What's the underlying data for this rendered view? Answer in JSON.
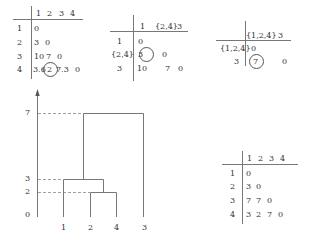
{
  "matrix_step1": {
    "col_headers": [
      "1",
      "2",
      "3",
      "4"
    ],
    "row_headers": [
      "1",
      "2",
      "3",
      "4"
    ],
    "rows": [
      [
        "0"
      ],
      [
        "3",
        "0"
      ],
      [
        "10",
        "7",
        "0"
      ],
      [
        "3.6",
        "2",
        "7.3",
        "0"
      ]
    ],
    "circled": "2"
  },
  "matrix_step2": {
    "col_headers": [
      "1",
      "{2,4}",
      "3"
    ],
    "row_headers": [
      "1",
      "{2,4}",
      "3"
    ],
    "rows": [
      [
        "0"
      ],
      [
        "3",
        "0"
      ],
      [
        "10",
        "7",
        "0"
      ]
    ],
    "circled": "3"
  },
  "matrix_step3": {
    "col_headers": [
      "{1,2,4}",
      "3"
    ],
    "row_headers": [
      "{1,2,4}",
      "3"
    ],
    "rows": [
      [
        "0"
      ],
      [
        "7",
        "0"
      ]
    ],
    "circled": "7"
  },
  "dendrogram": {
    "y_ticks": [
      "7",
      "3",
      "2",
      "0"
    ],
    "leaf_labels": [
      "1",
      "2",
      "4",
      "3"
    ],
    "merges": [
      {
        "clusters": [
          "2",
          "4"
        ],
        "height": 2
      },
      {
        "clusters": [
          "1",
          "{2,4}"
        ],
        "height": 3
      },
      {
        "clusters": [
          "{1,2,4}",
          "3"
        ],
        "height": 7
      }
    ]
  },
  "matrix_cophenetic": {
    "col_headers": [
      "1",
      "2",
      "3",
      "4"
    ],
    "row_headers": [
      "1",
      "2",
      "3",
      "4"
    ],
    "rows": [
      [
        "0"
      ],
      [
        "3",
        "0"
      ],
      [
        "7",
        "7",
        "0"
      ],
      [
        "3",
        "2",
        "7",
        "0"
      ]
    ]
  }
}
